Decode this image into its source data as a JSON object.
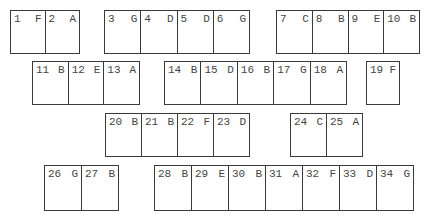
{
  "groups": [
    {
      "x": 10,
      "y": 10,
      "w": 70,
      "h": 44,
      "cells": [
        {
          "n": "1",
          "l": "F"
        },
        {
          "n": "2",
          "l": "A"
        }
      ]
    },
    {
      "x": 104,
      "y": 10,
      "w": 146,
      "h": 44,
      "cells": [
        {
          "n": "3",
          "l": "G"
        },
        {
          "n": "4",
          "l": "D"
        },
        {
          "n": "5",
          "l": "D"
        },
        {
          "n": "6",
          "l": "G"
        }
      ]
    },
    {
      "x": 276,
      "y": 10,
      "w": 144,
      "h": 44,
      "cells": [
        {
          "n": "7",
          "l": "C"
        },
        {
          "n": "8",
          "l": "B"
        },
        {
          "n": "9",
          "l": "E"
        },
        {
          "n": "10",
          "l": "B"
        }
      ]
    },
    {
      "x": 32,
      "y": 61,
      "w": 108,
      "h": 44,
      "cells": [
        {
          "n": "11",
          "l": "B"
        },
        {
          "n": "12",
          "l": "E"
        },
        {
          "n": "13",
          "l": "A"
        }
      ]
    },
    {
      "x": 164,
      "y": 61,
      "w": 183,
      "h": 44,
      "cells": [
        {
          "n": "14",
          "l": "B"
        },
        {
          "n": "15",
          "l": "D"
        },
        {
          "n": "16",
          "l": "B"
        },
        {
          "n": "17",
          "l": "G"
        },
        {
          "n": "18",
          "l": "A"
        }
      ]
    },
    {
      "x": 366,
      "y": 61,
      "w": 34,
      "h": 44,
      "cells": [
        {
          "n": "19",
          "l": "F"
        }
      ]
    },
    {
      "x": 105,
      "y": 113,
      "w": 145,
      "h": 44,
      "cells": [
        {
          "n": "20",
          "l": "B"
        },
        {
          "n": "21",
          "l": "B"
        },
        {
          "n": "22",
          "l": "F"
        },
        {
          "n": "23",
          "l": "D"
        }
      ]
    },
    {
      "x": 290,
      "y": 113,
      "w": 73,
      "h": 44,
      "cells": [
        {
          "n": "24",
          "l": "C"
        },
        {
          "n": "25",
          "l": "A"
        }
      ]
    },
    {
      "x": 44,
      "y": 165,
      "w": 75,
      "h": 46,
      "cells": [
        {
          "n": "26",
          "l": "G"
        },
        {
          "n": "27",
          "l": "B"
        }
      ]
    },
    {
      "x": 154,
      "y": 165,
      "w": 260,
      "h": 46,
      "cells": [
        {
          "n": "28",
          "l": "B"
        },
        {
          "n": "29",
          "l": "E"
        },
        {
          "n": "30",
          "l": "B"
        },
        {
          "n": "31",
          "l": "A"
        },
        {
          "n": "32",
          "l": "F"
        },
        {
          "n": "33",
          "l": "D"
        },
        {
          "n": "34",
          "l": "G"
        }
      ]
    }
  ],
  "colors": {
    "line": "#3a3a3a",
    "text": "#444444",
    "background": "#ffffff"
  }
}
